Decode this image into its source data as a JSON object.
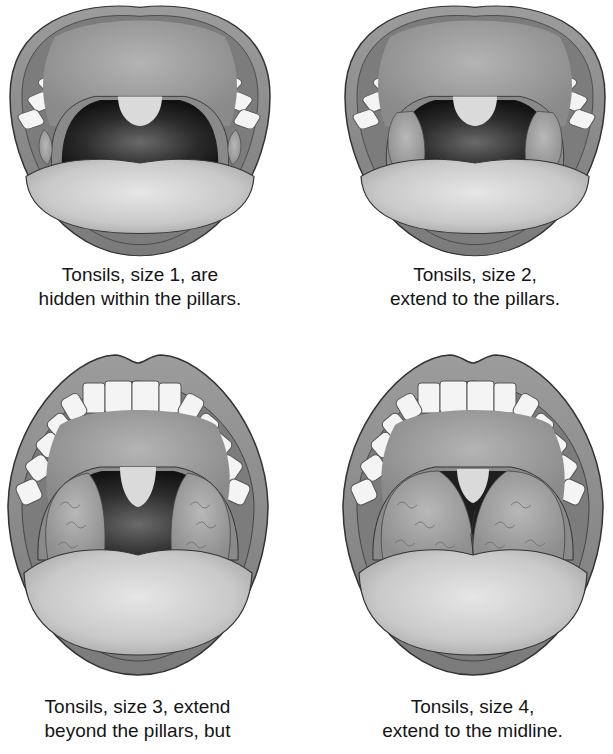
{
  "figure": {
    "palette": {
      "background": "#ffffff",
      "lip": "#8a8a8a",
      "lip_outline": "#3a3a3a",
      "inner_cheek": "#7c7c7c",
      "palate": "#9a9a9a",
      "teeth": "#f4f4f4",
      "throat_dark": "#1a1a1a",
      "pharynx": "#5a5a5a",
      "tonsil": "#a8a8a8",
      "tongue": "#cfcfcf",
      "uvula": "#d8d8d8"
    }
  },
  "panels": [
    {
      "id": "size-1",
      "grade": 1,
      "caption_lines": [
        "Tonsils, size 1, are",
        "hidden within the pillars."
      ]
    },
    {
      "id": "size-2",
      "grade": 2,
      "caption_lines": [
        "Tonsils, size 2,",
        "extend to the pillars."
      ]
    },
    {
      "id": "size-3",
      "grade": 3,
      "caption_lines": [
        "Tonsils, size 3, extend",
        "beyond the pillars, but"
      ]
    },
    {
      "id": "size-4",
      "grade": 4,
      "caption_lines": [
        "Tonsils, size 4,",
        "extend to the midline."
      ]
    }
  ]
}
